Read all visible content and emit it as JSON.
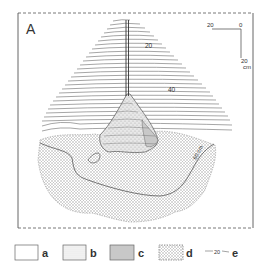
{
  "figure": {
    "panel_label": "A",
    "contour_labels": [
      "20",
      "40",
      "60 cm"
    ],
    "scale_bar": {
      "horizontal_left": "20",
      "origin": "0",
      "vertical_bottom": "20",
      "unit": "cm"
    }
  },
  "legend": {
    "items": [
      {
        "key": "a",
        "swatch": "blank"
      },
      {
        "key": "b",
        "swatch": "fine-dot"
      },
      {
        "key": "c",
        "swatch": "grey-fill"
      },
      {
        "key": "d",
        "swatch": "stipple-dashed-border"
      },
      {
        "key": "e",
        "swatch": "contour-line",
        "sample_value": "20"
      }
    ]
  },
  "colors": {
    "line": "#444444",
    "contour": "#6a6a6a",
    "stipple": "#9a9a9a",
    "grey_fill": "#c8c8c8"
  }
}
